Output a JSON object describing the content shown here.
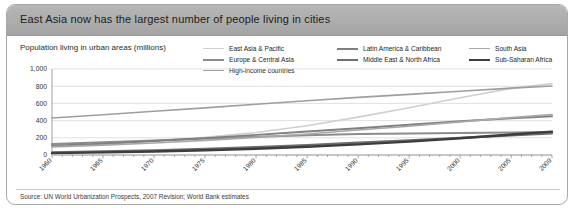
{
  "title": "East Asia now has the largest number of people living in cities",
  "subtitle": "Population living in urban areas (millions)",
  "source": "Source: UN World Urbanization Prospects, 2007 Revision; World Bank estimates",
  "legend": {
    "items": [
      {
        "label": "East Asia & Pacific",
        "color": "#cfcfcf",
        "width": 1.6
      },
      {
        "label": "Europe & Central Asia",
        "color": "#8c8c8c",
        "width": 2.0
      },
      {
        "label": "High-income countries",
        "color": "#9e9e9e",
        "width": 1.6
      },
      {
        "label": "Latin America & Caribbean",
        "color": "#808080",
        "width": 2.0
      },
      {
        "label": "Middle East & North Africa",
        "color": "#6e6e6e",
        "width": 2.2
      },
      {
        "label": "South Asia",
        "color": "#a8a8a8",
        "width": 1.6
      },
      {
        "label": "Sub-Saharan Africa",
        "color": "#3d3d3d",
        "width": 2.4
      }
    ]
  },
  "chart_data": {
    "type": "line",
    "title": "East Asia now has the largest number of people living in cities",
    "xlabel": "",
    "ylabel": "Population living in urban areas (millions)",
    "xlim": [
      1960,
      2009
    ],
    "ylim": [
      0,
      1000
    ],
    "yticks": [
      0,
      200,
      400,
      600,
      800,
      1000
    ],
    "ytick_labels": [
      "0",
      "200",
      "400",
      "600",
      "800",
      "1,000"
    ],
    "xticks": [
      1960,
      1965,
      1970,
      1975,
      1980,
      1985,
      1990,
      1995,
      2000,
      2005,
      2009
    ],
    "xtick_labels": [
      "1960",
      "1965",
      "1970",
      "1975",
      "1980",
      "1985",
      "1990",
      "1995",
      "2000",
      "2005",
      "2009"
    ],
    "grid": true,
    "legend_position": "top",
    "x": [
      1960,
      1965,
      1970,
      1975,
      1980,
      1985,
      1990,
      1995,
      2000,
      2005,
      2009
    ],
    "series": [
      {
        "name": "East Asia & Pacific",
        "color": "#cfcfcf",
        "width": 1.6,
        "values": [
          100,
          128,
          162,
          205,
          262,
          340,
          440,
          550,
          665,
          775,
          830
        ]
      },
      {
        "name": "Europe & Central Asia",
        "color": "#8c8c8c",
        "width": 2.0,
        "values": [
          128,
          148,
          170,
          192,
          212,
          230,
          244,
          250,
          255,
          262,
          268
        ]
      },
      {
        "name": "High-income countries",
        "color": "#9e9e9e",
        "width": 1.6,
        "values": [
          430,
          468,
          508,
          548,
          590,
          630,
          670,
          705,
          742,
          778,
          802
        ]
      },
      {
        "name": "Latin America & Caribbean",
        "color": "#808080",
        "width": 2.0,
        "values": [
          108,
          132,
          162,
          196,
          234,
          272,
          312,
          352,
          392,
          428,
          452
        ]
      },
      {
        "name": "Middle East & North Africa",
        "color": "#6e6e6e",
        "width": 2.2,
        "values": [
          32,
          42,
          55,
          72,
          92,
          116,
          143,
          170,
          198,
          228,
          250
        ]
      },
      {
        "name": "South Asia",
        "color": "#a8a8a8",
        "width": 1.6,
        "values": [
          95,
          115,
          140,
          170,
          205,
          245,
          290,
          335,
          385,
          435,
          470
        ]
      },
      {
        "name": "Sub-Saharan Africa",
        "color": "#3d3d3d",
        "width": 2.4,
        "values": [
          22,
          30,
          40,
          55,
          73,
          96,
          124,
          156,
          194,
          238,
          272
        ]
      }
    ]
  }
}
